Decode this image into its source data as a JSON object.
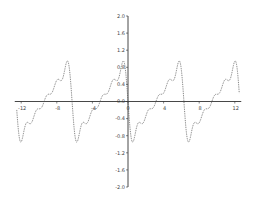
{
  "chart_data": {
    "type": "line",
    "title": "",
    "xlabel": "",
    "ylabel": "",
    "xlim": [
      -12.5,
      12.5
    ],
    "ylim": [
      -2.0,
      2.0
    ],
    "grid": false,
    "legend": null,
    "x_ticks": [
      -12,
      -8,
      -4,
      0,
      4,
      8,
      12
    ],
    "x_tick_labels": [
      "-12",
      "-8",
      "-4",
      "0",
      "4",
      "8",
      "12"
    ],
    "y_ticks": [
      2.0,
      1.6,
      1.2,
      0.8,
      0.4,
      0.0,
      -0.4,
      -0.8,
      -1.2,
      -1.6,
      -2.0
    ],
    "y_tick_labels": [
      "2.0",
      "1.6",
      "1.2",
      "0.8",
      "0.4",
      "0.0",
      "-0.4",
      "-0.8",
      "-1.2",
      "-1.6",
      "-2.0"
    ],
    "series": [
      {
        "name": "f(x)",
        "style": "dotted",
        "color": "#555555",
        "description": "Periodic sawtooth-like Fourier partial sum, period ~6.28, rising from about -1.1 to about 1.1 with small ripples, dropping sharply at multiples of 2π",
        "formula_estimate": "-0.6 * sum_{k=1..5} sin(k x)/k",
        "x": [
          -12.5,
          -12,
          -11,
          -10,
          -9.4,
          -9,
          -8,
          -7,
          -6.5,
          -6.28,
          -6,
          -5.5,
          -5,
          -4,
          -3,
          -2,
          -1,
          -0.5,
          0,
          0.5,
          1,
          2,
          3,
          4,
          5,
          5.5,
          6,
          6.28,
          6.5,
          7,
          8,
          9,
          10,
          11,
          12,
          12.5
        ],
        "y": [
          0.55,
          -0.3,
          -1.1,
          -0.6,
          -0.2,
          0.1,
          0.3,
          0.6,
          1.1,
          0.0,
          -1.1,
          -0.8,
          -0.65,
          -0.45,
          -0.1,
          0.3,
          0.55,
          0.8,
          0.0,
          -1.1,
          -0.8,
          -0.45,
          -0.05,
          0.3,
          0.7,
          0.95,
          1.1,
          0.0,
          -1.1,
          -0.85,
          -0.5,
          -0.15,
          0.3,
          0.65,
          1.1,
          -0.5
        ]
      }
    ]
  },
  "axes": {
    "x_origin_label": "0",
    "y_origin_label": "0.0"
  }
}
